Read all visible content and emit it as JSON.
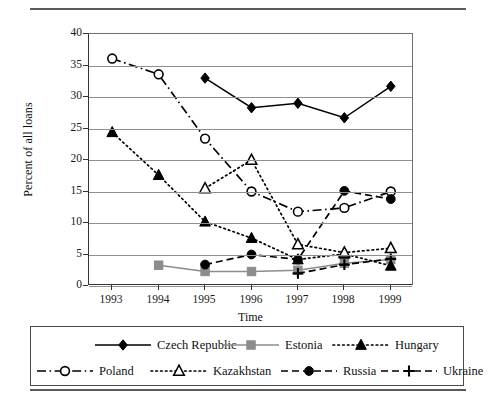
{
  "figure": {
    "has_top_rule": true,
    "has_bottom_rule": true
  },
  "chart_data": {
    "type": "line",
    "title": "",
    "xlabel": "Time",
    "ylabel": "Percent of all loans",
    "categories": [
      "1993",
      "1994",
      "1995",
      "1996",
      "1997",
      "1998",
      "1999"
    ],
    "x": [
      1993,
      1994,
      1995,
      1996,
      1997,
      1998,
      1999
    ],
    "ylim": [
      0,
      40
    ],
    "yticks": [
      0,
      5,
      10,
      15,
      20,
      25,
      30,
      35,
      40
    ],
    "grid": true,
    "legend_position": "below-plot",
    "series": [
      {
        "name": "Czech Republic",
        "marker": "filled-diamond",
        "line_style": "solid",
        "color": "#000000",
        "values": [
          null,
          null,
          33.0,
          28.3,
          29.0,
          26.7,
          31.7
        ]
      },
      {
        "name": "Estonia",
        "marker": "filled-square",
        "line_style": "solid",
        "color": "#8c8c8c",
        "values": [
          null,
          3.3,
          2.3,
          2.3,
          2.5,
          3.6,
          4.2
        ]
      },
      {
        "name": "Hungary",
        "marker": "filled-triangle",
        "line_style": "dotted",
        "color": "#000000",
        "values": [
          24.4,
          17.6,
          10.2,
          7.6,
          4.2,
          5.1,
          3.2
        ]
      },
      {
        "name": "Poland",
        "marker": "open-circle",
        "line_style": "dash-dot",
        "color": "#000000",
        "values": [
          36.1,
          33.6,
          23.4,
          15.0,
          11.8,
          12.4,
          15.0
        ]
      },
      {
        "name": "Kazakhstan",
        "marker": "open-triangle",
        "line_style": "dotted",
        "color": "#000000",
        "values": [
          null,
          null,
          15.5,
          20.0,
          6.6,
          5.3,
          6.0
        ]
      },
      {
        "name": "Russia",
        "marker": "filled-circle",
        "line_style": "dashed",
        "color": "#000000",
        "values": [
          null,
          null,
          3.4,
          5.0,
          4.2,
          15.1,
          13.8
        ]
      },
      {
        "name": "Ukraine",
        "marker": "plus",
        "line_style": "dashed",
        "color": "#000000",
        "values": [
          null,
          null,
          null,
          null,
          2.0,
          3.4,
          4.3
        ]
      }
    ]
  },
  "legend": {
    "items": [
      {
        "label": "Czech Republic",
        "key": "legend-key-czech-republic"
      },
      {
        "label": "Estonia",
        "key": "legend-key-estonia"
      },
      {
        "label": "Hungary",
        "key": "legend-key-hungary"
      },
      {
        "label": "Poland",
        "key": "legend-key-poland"
      },
      {
        "label": "Kazakhstan",
        "key": "legend-key-kazakhstan"
      },
      {
        "label": "Russia",
        "key": "legend-key-russia"
      },
      {
        "label": "Ukraine",
        "key": "legend-key-ukraine"
      }
    ]
  }
}
